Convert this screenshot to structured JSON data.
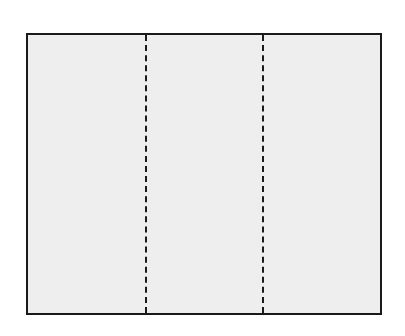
{
  "diagram": {
    "panel_count": 3,
    "fill_color": "#eeeeee",
    "border_color": "#1a1a1a",
    "fold_line_style": "dashed",
    "fold_lines_x": [
      145,
      262
    ]
  }
}
